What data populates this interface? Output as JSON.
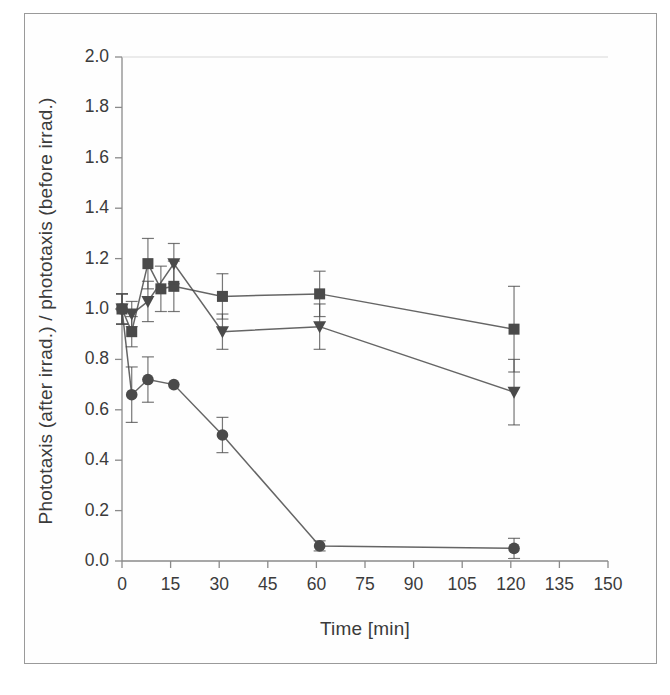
{
  "figure": {
    "background": "#ffffff",
    "frame_color": "#9a9a9a",
    "axis_color": "#8a8a8a",
    "ink_color": "#3b3b3b"
  },
  "chart_data": {
    "type": "line",
    "title": "",
    "xlabel": "Time [min]",
    "ylabel": "Phototaxis (after irrad.) / phototaxis (before irrad.)",
    "xlim": [
      0,
      150
    ],
    "ylim": [
      0.0,
      2.0
    ],
    "xticks": [
      0,
      15,
      30,
      45,
      60,
      75,
      90,
      105,
      120,
      135,
      150
    ],
    "xtick_labels": [
      "0",
      "15",
      "30",
      "45",
      "60",
      "75",
      "90",
      "105",
      "120",
      "135",
      "150"
    ],
    "yticks": [
      0.0,
      0.2,
      0.4,
      0.6,
      0.8,
      1.0,
      1.2,
      1.4,
      1.6,
      1.8,
      2.0
    ],
    "ytick_labels": [
      "0.0",
      "0.2",
      "0.4",
      "0.6",
      "0.8",
      "1.0",
      "1.2",
      "1.4",
      "1.6",
      "1.8",
      "2.0"
    ],
    "grid": false,
    "legend": "none",
    "errorbars": true,
    "series": [
      {
        "name": "series-square",
        "marker": "square",
        "color": "#4a4a4a",
        "x": [
          0,
          3,
          8,
          12,
          16,
          31,
          61,
          121
        ],
        "y": [
          1.0,
          0.91,
          1.18,
          1.08,
          1.09,
          1.05,
          1.06,
          0.92
        ],
        "yerr": [
          0.06,
          0.06,
          0.1,
          0.09,
          0.1,
          0.09,
          0.09,
          0.17
        ]
      },
      {
        "name": "series-triangle",
        "marker": "triangle-down",
        "color": "#4a4a4a",
        "x": [
          0,
          3,
          8,
          16,
          31,
          61,
          121
        ],
        "y": [
          1.0,
          0.98,
          1.03,
          1.18,
          0.91,
          0.93,
          0.67
        ],
        "yerr": [
          0.06,
          0.05,
          0.08,
          0.08,
          0.07,
          0.09,
          0.13
        ]
      },
      {
        "name": "series-circle",
        "marker": "circle",
        "color": "#4a4a4a",
        "x": [
          0,
          3,
          8,
          16,
          31,
          61,
          121
        ],
        "y": [
          1.0,
          0.66,
          0.72,
          0.7,
          0.5,
          0.06,
          0.05
        ],
        "yerr": [
          0.06,
          0.11,
          0.09,
          0.0,
          0.07,
          0.02,
          0.04
        ]
      }
    ]
  }
}
